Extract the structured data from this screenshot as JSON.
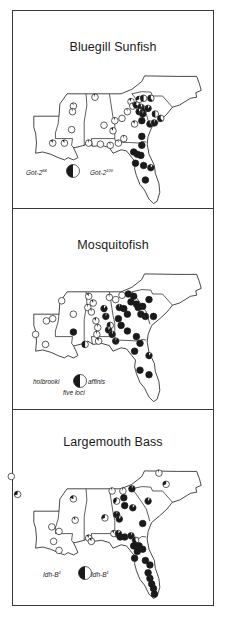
{
  "figure": {
    "panels": [
      {
        "id": "bluegill",
        "title": "Bluegill Sunfish",
        "legend": {
          "left_label": "Got-2",
          "left_sup": "84",
          "right_label": "Got-2",
          "right_sup": "100",
          "note": ""
        },
        "sites": [
          [
            -91.9,
            30.6,
            0.1
          ],
          [
            -90.6,
            30.6,
            0.1
          ],
          [
            -89.6,
            33.9,
            0.05
          ],
          [
            -89.7,
            33.4,
            0.05
          ],
          [
            -89.8,
            31.8,
            0.0
          ],
          [
            -87.2,
            34.7,
            0.05
          ],
          [
            -86.2,
            32.2,
            0.0
          ],
          [
            -85.2,
            31.7,
            0.1
          ],
          [
            -85.0,
            32.6,
            0.05
          ],
          [
            -83.6,
            33.4,
            0.05
          ],
          [
            -84.2,
            32.8,
            0.0
          ],
          [
            -82.8,
            32.3,
            0.1
          ],
          [
            -83.2,
            34.3,
            0.1
          ],
          [
            -83.0,
            33.9,
            0.05
          ],
          [
            -82.3,
            34.5,
            0.3
          ],
          [
            -81.8,
            34.6,
            0.5
          ],
          [
            -81.0,
            34.6,
            0.6
          ],
          [
            -82.6,
            34.0,
            0.7
          ],
          [
            -82.1,
            33.8,
            0.9
          ],
          [
            -81.7,
            33.6,
            0.95
          ],
          [
            -81.3,
            33.7,
            0.9
          ],
          [
            -82.3,
            33.4,
            0.9
          ],
          [
            -81.9,
            33.2,
            0.95
          ],
          [
            -82.0,
            32.6,
            1.0
          ],
          [
            -80.5,
            33.2,
            0.5
          ],
          [
            -79.9,
            32.8,
            0.6
          ],
          [
            -81.1,
            32.3,
            0.9
          ],
          [
            -80.6,
            32.4,
            0.95
          ],
          [
            -82.0,
            31.2,
            1.0
          ],
          [
            -82.0,
            30.4,
            1.0
          ],
          [
            -82.9,
            29.8,
            1.0
          ],
          [
            -82.5,
            29.6,
            1.0
          ],
          [
            -82.1,
            29.5,
            1.0
          ],
          [
            -82.7,
            28.8,
            1.0
          ],
          [
            -81.8,
            28.6,
            1.0
          ],
          [
            -81.0,
            28.4,
            0.9
          ],
          [
            -81.6,
            27.3,
            1.0
          ],
          [
            -84.0,
            31.0,
            0.05
          ],
          [
            -86.6,
            30.5,
            0.0
          ],
          [
            -85.5,
            30.4,
            0.05
          ],
          [
            -84.6,
            30.6,
            0.05
          ],
          [
            -87.9,
            30.6,
            0.05
          ]
        ]
      },
      {
        "id": "mosquitofish",
        "title": "Mosquitofish",
        "legend": {
          "left_label": "holbrooki",
          "left_sup": "",
          "right_label": "affinis",
          "right_sup": "",
          "note": "five loci"
        },
        "sites": [
          [
            -93.8,
            31.2,
            0.0
          ],
          [
            -92.6,
            32.4,
            0.0
          ],
          [
            -91.9,
            32.6,
            0.0
          ],
          [
            -92.7,
            30.3,
            0.0
          ],
          [
            -90.9,
            34.2,
            0.0
          ],
          [
            -89.6,
            33.0,
            0.0
          ],
          [
            -89.6,
            31.4,
            1.0
          ],
          [
            -88.3,
            30.3,
            0.5
          ],
          [
            -88.0,
            33.6,
            0.05
          ],
          [
            -87.9,
            34.6,
            0.1
          ],
          [
            -87.4,
            34.0,
            0.1
          ],
          [
            -87.6,
            33.2,
            0.05
          ],
          [
            -87.1,
            32.4,
            0.1
          ],
          [
            -86.9,
            31.8,
            0.05
          ],
          [
            -87.0,
            31.2,
            0.05
          ],
          [
            -86.8,
            30.6,
            0.1
          ],
          [
            -85.6,
            34.5,
            0.05
          ],
          [
            -86.2,
            33.5,
            0.9
          ],
          [
            -86.0,
            32.8,
            0.95
          ],
          [
            -85.5,
            32.0,
            0.5
          ],
          [
            -85.7,
            31.6,
            0.9
          ],
          [
            -85.3,
            31.2,
            0.95
          ],
          [
            -84.9,
            30.6,
            0.95
          ],
          [
            -84.9,
            34.3,
            0.0
          ],
          [
            -84.2,
            34.7,
            0.0
          ],
          [
            -83.5,
            34.8,
            1.0
          ],
          [
            -82.9,
            34.6,
            1.0
          ],
          [
            -81.2,
            34.3,
            1.0
          ],
          [
            -83.2,
            34.1,
            1.0
          ],
          [
            -82.6,
            33.9,
            1.0
          ],
          [
            -84.5,
            33.6,
            0.95
          ],
          [
            -84.0,
            33.5,
            1.0
          ],
          [
            -83.6,
            33.0,
            1.0
          ],
          [
            -82.4,
            33.6,
            1.0
          ],
          [
            -81.9,
            33.7,
            1.0
          ],
          [
            -82.1,
            33.0,
            1.0
          ],
          [
            -81.6,
            32.8,
            1.0
          ],
          [
            -80.7,
            32.8,
            1.0
          ],
          [
            -84.6,
            32.6,
            1.0
          ],
          [
            -84.3,
            32.0,
            1.0
          ],
          [
            -83.6,
            31.5,
            1.0
          ],
          [
            -82.6,
            31.0,
            1.0
          ],
          [
            -82.2,
            30.4,
            1.0
          ],
          [
            -82.8,
            29.7,
            1.0
          ],
          [
            -81.2,
            29.3,
            0.9
          ],
          [
            -82.2,
            28.0,
            1.0
          ],
          [
            -81.2,
            27.6,
            1.0
          ]
        ]
      },
      {
        "id": "largemouth",
        "title": "Largemouth Bass",
        "legend": {
          "left_label": "Idh-B",
          "left_sup": "2",
          "right_label": "Idh-B",
          "right_sup": "1",
          "note": ""
        },
        "sites": [
          [
            -96.5,
            36.1,
            0.0
          ],
          [
            -95.8,
            34.5,
            0.3
          ],
          [
            -92.0,
            31.6,
            0.0
          ],
          [
            -91.2,
            31.2,
            0.0
          ],
          [
            -91.8,
            30.3,
            0.0
          ],
          [
            -91.2,
            29.5,
            0.0
          ],
          [
            -89.6,
            34.1,
            0.2
          ],
          [
            -89.4,
            32.2,
            0.1
          ],
          [
            -87.9,
            30.6,
            0.1
          ],
          [
            -87.6,
            30.3,
            0.1
          ],
          [
            -86.1,
            32.4,
            0.3
          ],
          [
            -85.3,
            34.8,
            0.05
          ],
          [
            -84.8,
            33.9,
            0.4
          ],
          [
            -84.1,
            34.8,
            0.05
          ],
          [
            -83.1,
            35.0,
            0.95
          ],
          [
            -84.0,
            34.2,
            1.0
          ],
          [
            -83.9,
            33.5,
            1.0
          ],
          [
            -83.0,
            33.3,
            0.9
          ],
          [
            -84.8,
            32.7,
            0.95
          ],
          [
            -84.5,
            32.3,
            0.9
          ],
          [
            -81.9,
            31.9,
            1.0
          ],
          [
            -85.1,
            31.0,
            0.1
          ],
          [
            -84.6,
            31.0,
            0.9
          ],
          [
            -84.4,
            30.7,
            1.0
          ],
          [
            -83.9,
            30.7,
            1.0
          ],
          [
            -83.2,
            30.8,
            0.95
          ],
          [
            -82.7,
            30.4,
            0.6
          ],
          [
            -82.9,
            29.9,
            1.0
          ],
          [
            -82.3,
            29.9,
            1.0
          ],
          [
            -82.5,
            29.4,
            1.0
          ],
          [
            -81.9,
            29.6,
            1.0
          ],
          [
            -82.8,
            28.8,
            1.0
          ],
          [
            -81.6,
            28.6,
            1.0
          ],
          [
            -81.1,
            28.2,
            1.0
          ],
          [
            -81.3,
            27.5,
            1.0
          ],
          [
            -81.1,
            27.0,
            1.0
          ],
          [
            -80.9,
            26.5,
            1.0
          ],
          [
            -80.7,
            26.1,
            1.0
          ],
          [
            -80.6,
            25.6,
            1.0
          ],
          [
            -80.1,
            36.4,
            0.05
          ],
          [
            -79.3,
            35.4,
            0.3
          ],
          [
            -81.3,
            33.9,
            0.9
          ]
        ]
      }
    ]
  },
  "colors": {
    "ink": "#1a1a1a",
    "paper": "#ffffff"
  }
}
